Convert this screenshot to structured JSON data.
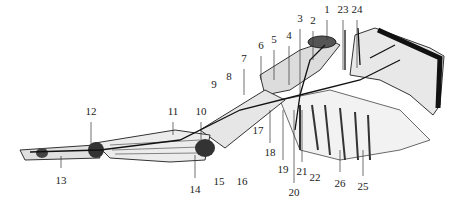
{
  "diagram": {
    "type": "anatomical-illustration",
    "labels": [
      {
        "id": "1",
        "x": 327,
        "y": 10
      },
      {
        "id": "2",
        "x": 313,
        "y": 21
      },
      {
        "id": "3",
        "x": 300,
        "y": 19
      },
      {
        "id": "4",
        "x": 289,
        "y": 36
      },
      {
        "id": "5",
        "x": 274,
        "y": 40
      },
      {
        "id": "6",
        "x": 261,
        "y": 46
      },
      {
        "id": "7",
        "x": 244,
        "y": 59
      },
      {
        "id": "8",
        "x": 229,
        "y": 77
      },
      {
        "id": "9",
        "x": 214,
        "y": 85
      },
      {
        "id": "10",
        "x": 201,
        "y": 112
      },
      {
        "id": "11",
        "x": 173,
        "y": 112
      },
      {
        "id": "12",
        "x": 91,
        "y": 112
      },
      {
        "id": "13",
        "x": 61,
        "y": 181
      },
      {
        "id": "14",
        "x": 195,
        "y": 190
      },
      {
        "id": "15",
        "x": 219,
        "y": 182
      },
      {
        "id": "16",
        "x": 242,
        "y": 182
      },
      {
        "id": "17",
        "x": 258,
        "y": 131
      },
      {
        "id": "18",
        "x": 270,
        "y": 153
      },
      {
        "id": "19",
        "x": 283,
        "y": 170
      },
      {
        "id": "20",
        "x": 294,
        "y": 193
      },
      {
        "id": "21",
        "x": 302,
        "y": 172
      },
      {
        "id": "22",
        "x": 315,
        "y": 178
      },
      {
        "id": "23",
        "x": 343,
        "y": 10
      },
      {
        "id": "24",
        "x": 357,
        "y": 10
      },
      {
        "id": "25",
        "x": 363,
        "y": 187
      },
      {
        "id": "26",
        "x": 340,
        "y": 184
      }
    ]
  }
}
